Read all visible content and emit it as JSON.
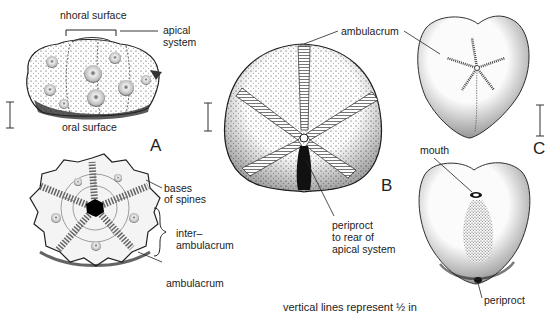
{
  "figure": {
    "caption": "vertical lines represent ½ in",
    "panels": [
      {
        "id": "A",
        "letter": "A",
        "description": "Regular echinoid, side and oral views",
        "labels": {
          "aboral_surface": "nhoral surface",
          "apical_system_line1": "apical",
          "apical_system_line2": "system",
          "oral_surface": "oral surface",
          "bases_of_spines_line1": "bases",
          "bases_of_spines_line2": "of spines",
          "interambulacrum_line1": "inter–",
          "interambulacrum_line2": "ambulacrum",
          "ambulacrum": "ambulacrum"
        }
      },
      {
        "id": "B",
        "letter": "B",
        "description": "Irregular echinoid, aboral view",
        "labels": {
          "ambulacrum": "ambulacrum",
          "periproct_line1": "periproct",
          "periproct_line2": "to rear of",
          "periproct_line3": "apical system"
        }
      },
      {
        "id": "C",
        "letter": "C",
        "description": "Heart urchin, aboral and oral views",
        "labels": {
          "ambulacrum": "ambulacrum",
          "mouth": "mouth",
          "periproct": "periproct"
        }
      }
    ],
    "scale_bars": [
      {
        "panel": "A",
        "x": 10,
        "y1": 102,
        "y2": 128
      },
      {
        "panel": "B",
        "x": 208,
        "y1": 103,
        "y2": 131
      },
      {
        "panel": "C",
        "x": 540,
        "y1": 105,
        "y2": 136
      }
    ]
  }
}
